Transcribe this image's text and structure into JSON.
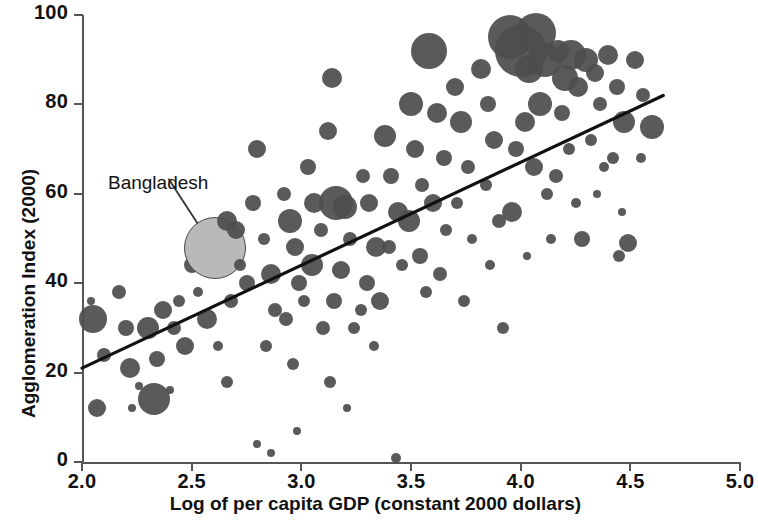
{
  "chart_data": {
    "type": "scatter",
    "title": "",
    "subtitle": "",
    "xlabel": "Log of per capita GDP (constant 2000 dollars)",
    "ylabel": "Agglomeration Index (2000)",
    "xlim": [
      2.0,
      5.0
    ],
    "ylim": [
      0,
      100
    ],
    "xticks": [
      "2.0",
      "2.5",
      "3.0",
      "3.5",
      "4.0",
      "4.5",
      "5.0"
    ],
    "yticks": [
      "0",
      "20",
      "40",
      "60",
      "80",
      "100"
    ],
    "grid": false,
    "legend": "none",
    "bubble_note": "Marker area encodes a third variable (population size)",
    "annotations": [
      {
        "text": "Bangladesh",
        "x": 2.6,
        "y": 48,
        "label_x": 2.13,
        "label_y": 62
      }
    ],
    "trendline": {
      "type": "linear",
      "x_start": 2.0,
      "y_start": 21.0,
      "x_end": 4.65,
      "y_end": 82.0,
      "color": "#111111"
    },
    "colors": {
      "bubble": "#4d4d4d",
      "highlight": "#b9b9b9",
      "axis": "#555555",
      "text": "#111111"
    },
    "points": [
      {
        "x": 2.05,
        "y": 32,
        "r": 14
      },
      {
        "x": 2.04,
        "y": 36,
        "r": 4
      },
      {
        "x": 2.1,
        "y": 24,
        "r": 7
      },
      {
        "x": 2.07,
        "y": 12,
        "r": 9
      },
      {
        "x": 2.17,
        "y": 38,
        "r": 7
      },
      {
        "x": 2.2,
        "y": 30,
        "r": 8
      },
      {
        "x": 2.22,
        "y": 21,
        "r": 10
      },
      {
        "x": 2.26,
        "y": 17,
        "r": 4
      },
      {
        "x": 2.23,
        "y": 12,
        "r": 4
      },
      {
        "x": 2.3,
        "y": 30,
        "r": 11
      },
      {
        "x": 2.34,
        "y": 23,
        "r": 8
      },
      {
        "x": 2.37,
        "y": 34,
        "r": 9
      },
      {
        "x": 2.33,
        "y": 14,
        "r": 16
      },
      {
        "x": 2.42,
        "y": 30,
        "r": 7
      },
      {
        "x": 2.44,
        "y": 36,
        "r": 6
      },
      {
        "x": 2.47,
        "y": 26,
        "r": 9
      },
      {
        "x": 2.4,
        "y": 16,
        "r": 4
      },
      {
        "x": 2.5,
        "y": 44,
        "r": 8
      },
      {
        "x": 2.53,
        "y": 38,
        "r": 5
      },
      {
        "x": 2.57,
        "y": 32,
        "r": 10
      },
      {
        "x": 2.6,
        "y": 48,
        "r": 30,
        "highlight": true
      },
      {
        "x": 2.66,
        "y": 54,
        "r": 10
      },
      {
        "x": 2.7,
        "y": 52,
        "r": 9
      },
      {
        "x": 2.72,
        "y": 44,
        "r": 6
      },
      {
        "x": 2.75,
        "y": 40,
        "r": 8
      },
      {
        "x": 2.68,
        "y": 36,
        "r": 7
      },
      {
        "x": 2.62,
        "y": 26,
        "r": 5
      },
      {
        "x": 2.66,
        "y": 18,
        "r": 6
      },
      {
        "x": 2.78,
        "y": 58,
        "r": 8
      },
      {
        "x": 2.8,
        "y": 70,
        "r": 9
      },
      {
        "x": 2.83,
        "y": 50,
        "r": 6
      },
      {
        "x": 2.86,
        "y": 42,
        "r": 10
      },
      {
        "x": 2.88,
        "y": 34,
        "r": 7
      },
      {
        "x": 2.84,
        "y": 26,
        "r": 6
      },
      {
        "x": 2.8,
        "y": 4,
        "r": 4
      },
      {
        "x": 2.86,
        "y": 2,
        "r": 4
      },
      {
        "x": 2.92,
        "y": 60,
        "r": 7
      },
      {
        "x": 2.95,
        "y": 54,
        "r": 12
      },
      {
        "x": 2.97,
        "y": 48,
        "r": 9
      },
      {
        "x": 2.99,
        "y": 40,
        "r": 8
      },
      {
        "x": 2.93,
        "y": 32,
        "r": 7
      },
      {
        "x": 2.96,
        "y": 22,
        "r": 6
      },
      {
        "x": 2.98,
        "y": 7,
        "r": 4
      },
      {
        "x": 3.03,
        "y": 66,
        "r": 8
      },
      {
        "x": 3.06,
        "y": 58,
        "r": 10
      },
      {
        "x": 3.09,
        "y": 52,
        "r": 7
      },
      {
        "x": 3.05,
        "y": 44,
        "r": 11
      },
      {
        "x": 3.01,
        "y": 36,
        "r": 6
      },
      {
        "x": 3.1,
        "y": 30,
        "r": 7
      },
      {
        "x": 3.12,
        "y": 74,
        "r": 9
      },
      {
        "x": 3.14,
        "y": 86,
        "r": 10
      },
      {
        "x": 3.16,
        "y": 58,
        "r": 17
      },
      {
        "x": 3.2,
        "y": 57,
        "r": 12
      },
      {
        "x": 3.22,
        "y": 50,
        "r": 7
      },
      {
        "x": 3.18,
        "y": 43,
        "r": 9
      },
      {
        "x": 3.15,
        "y": 36,
        "r": 8
      },
      {
        "x": 3.24,
        "y": 30,
        "r": 6
      },
      {
        "x": 3.13,
        "y": 18,
        "r": 6
      },
      {
        "x": 3.21,
        "y": 12,
        "r": 4
      },
      {
        "x": 3.28,
        "y": 64,
        "r": 7
      },
      {
        "x": 3.31,
        "y": 58,
        "r": 9
      },
      {
        "x": 3.34,
        "y": 48,
        "r": 10
      },
      {
        "x": 3.3,
        "y": 40,
        "r": 8
      },
      {
        "x": 3.27,
        "y": 34,
        "r": 6
      },
      {
        "x": 3.33,
        "y": 26,
        "r": 5
      },
      {
        "x": 3.36,
        "y": 36,
        "r": 9
      },
      {
        "x": 3.38,
        "y": 73,
        "r": 11
      },
      {
        "x": 3.41,
        "y": 64,
        "r": 8
      },
      {
        "x": 3.44,
        "y": 56,
        "r": 10
      },
      {
        "x": 3.4,
        "y": 48,
        "r": 7
      },
      {
        "x": 3.46,
        "y": 44,
        "r": 6
      },
      {
        "x": 3.43,
        "y": 1,
        "r": 5
      },
      {
        "x": 3.5,
        "y": 80,
        "r": 12
      },
      {
        "x": 3.52,
        "y": 70,
        "r": 9
      },
      {
        "x": 3.55,
        "y": 62,
        "r": 7
      },
      {
        "x": 3.49,
        "y": 54,
        "r": 11
      },
      {
        "x": 3.54,
        "y": 46,
        "r": 8
      },
      {
        "x": 3.57,
        "y": 38,
        "r": 6
      },
      {
        "x": 3.58,
        "y": 92,
        "r": 18
      },
      {
        "x": 3.62,
        "y": 78,
        "r": 10
      },
      {
        "x": 3.65,
        "y": 68,
        "r": 8
      },
      {
        "x": 3.6,
        "y": 58,
        "r": 9
      },
      {
        "x": 3.66,
        "y": 52,
        "r": 6
      },
      {
        "x": 3.63,
        "y": 42,
        "r": 7
      },
      {
        "x": 3.7,
        "y": 84,
        "r": 9
      },
      {
        "x": 3.73,
        "y": 76,
        "r": 11
      },
      {
        "x": 3.76,
        "y": 66,
        "r": 7
      },
      {
        "x": 3.71,
        "y": 58,
        "r": 6
      },
      {
        "x": 3.78,
        "y": 50,
        "r": 5
      },
      {
        "x": 3.74,
        "y": 36,
        "r": 6
      },
      {
        "x": 3.82,
        "y": 88,
        "r": 10
      },
      {
        "x": 3.85,
        "y": 80,
        "r": 8
      },
      {
        "x": 3.88,
        "y": 72,
        "r": 9
      },
      {
        "x": 3.84,
        "y": 62,
        "r": 6
      },
      {
        "x": 3.9,
        "y": 54,
        "r": 7
      },
      {
        "x": 3.86,
        "y": 44,
        "r": 5
      },
      {
        "x": 3.95,
        "y": 95,
        "r": 22
      },
      {
        "x": 4.0,
        "y": 92,
        "r": 26
      },
      {
        "x": 4.04,
        "y": 88,
        "r": 14
      },
      {
        "x": 4.07,
        "y": 96,
        "r": 20
      },
      {
        "x": 4.11,
        "y": 90,
        "r": 17
      },
      {
        "x": 4.09,
        "y": 80,
        "r": 12
      },
      {
        "x": 4.02,
        "y": 76,
        "r": 10
      },
      {
        "x": 3.98,
        "y": 70,
        "r": 8
      },
      {
        "x": 4.06,
        "y": 66,
        "r": 9
      },
      {
        "x": 4.12,
        "y": 60,
        "r": 6
      },
      {
        "x": 3.96,
        "y": 56,
        "r": 10
      },
      {
        "x": 4.14,
        "y": 50,
        "r": 5
      },
      {
        "x": 4.03,
        "y": 46,
        "r": 4
      },
      {
        "x": 3.92,
        "y": 30,
        "r": 6
      },
      {
        "x": 4.17,
        "y": 92,
        "r": 11
      },
      {
        "x": 4.2,
        "y": 86,
        "r": 13
      },
      {
        "x": 4.23,
        "y": 91,
        "r": 15
      },
      {
        "x": 4.26,
        "y": 84,
        "r": 10
      },
      {
        "x": 4.19,
        "y": 78,
        "r": 8
      },
      {
        "x": 4.22,
        "y": 70,
        "r": 6
      },
      {
        "x": 4.16,
        "y": 64,
        "r": 7
      },
      {
        "x": 4.25,
        "y": 58,
        "r": 5
      },
      {
        "x": 4.28,
        "y": 50,
        "r": 8
      },
      {
        "x": 4.3,
        "y": 90,
        "r": 12
      },
      {
        "x": 4.34,
        "y": 87,
        "r": 9
      },
      {
        "x": 4.36,
        "y": 80,
        "r": 7
      },
      {
        "x": 4.32,
        "y": 72,
        "r": 6
      },
      {
        "x": 4.38,
        "y": 66,
        "r": 5
      },
      {
        "x": 4.35,
        "y": 60,
        "r": 4
      },
      {
        "x": 4.4,
        "y": 91,
        "r": 10
      },
      {
        "x": 4.44,
        "y": 84,
        "r": 8
      },
      {
        "x": 4.47,
        "y": 76,
        "r": 11
      },
      {
        "x": 4.42,
        "y": 68,
        "r": 6
      },
      {
        "x": 4.49,
        "y": 49,
        "r": 9
      },
      {
        "x": 4.45,
        "y": 46,
        "r": 6
      },
      {
        "x": 4.52,
        "y": 90,
        "r": 9
      },
      {
        "x": 4.56,
        "y": 82,
        "r": 7
      },
      {
        "x": 4.6,
        "y": 75,
        "r": 12
      },
      {
        "x": 4.55,
        "y": 68,
        "r": 5
      },
      {
        "x": 4.46,
        "y": 56,
        "r": 4
      }
    ]
  }
}
